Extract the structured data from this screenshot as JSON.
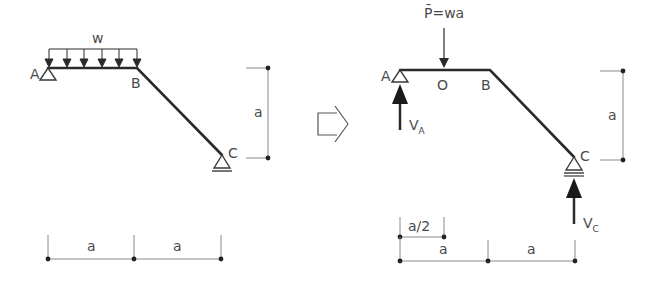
{
  "left_diagram": {
    "load_label": "w",
    "point_A": "A",
    "point_B": "B",
    "point_C": "C",
    "vertical_dim": "a",
    "horizontal_dims": [
      "a",
      "a"
    ]
  },
  "transform_arrow": "hollow-right-arrow",
  "right_diagram": {
    "load_label": "P̄=wa",
    "point_A": "A",
    "point_O": "O",
    "point_B": "B",
    "point_C": "C",
    "reaction_A": "V",
    "reaction_A_sub": "A",
    "reaction_C": "V",
    "reaction_C_sub": "C",
    "vertical_dim": "a",
    "half_dim": "a/2",
    "horizontal_dims": [
      "a",
      "a"
    ]
  },
  "colors": {
    "beam": "#2a2a2a",
    "dimension": "#8a8a8a",
    "text": "#4a4a4a"
  }
}
